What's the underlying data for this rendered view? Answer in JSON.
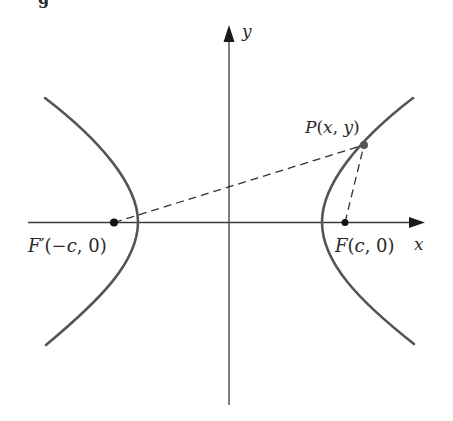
{
  "figure": {
    "caption_fragment": "g",
    "axes": {
      "x_label": "x",
      "y_label": "y"
    },
    "points": {
      "P": {
        "label": "P(x, y)",
        "label_parts": [
          "P",
          "(",
          "x",
          ", ",
          "y",
          ")"
        ]
      },
      "F": {
        "label": "F(c, 0)",
        "label_parts": [
          "F",
          "(",
          "c",
          ", 0)"
        ]
      },
      "F_prime": {
        "label": "F′(−c, 0)",
        "label_parts": [
          "F",
          "′(−",
          "c",
          ", 0)"
        ]
      }
    },
    "curve": "hyperbola with foci F′(−c, 0) and F(c, 0)",
    "segments": [
      "PF′ (dashed)",
      "PF (dashed)"
    ],
    "colors": {
      "curve": "#555555",
      "axes": "#3a3a3a",
      "dots": "#111111",
      "p_dot": "#555555",
      "text": "#2a2a2a"
    }
  }
}
